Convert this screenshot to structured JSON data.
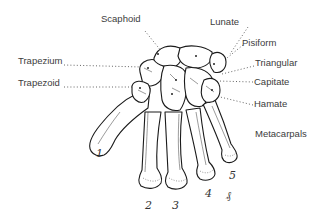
{
  "diagram": {
    "labels": {
      "scaphoid": "Scaphoid",
      "lunate": "Lunate",
      "pisiform": "Pisiform",
      "triangular": "Triangular",
      "trapezium": "Trapezium",
      "trapezoid": "Trapezoid",
      "capitate": "Capitate",
      "hamate": "Hamate",
      "metacarpals": "Metacarpals"
    },
    "metacarpal_numbers": [
      "1",
      "2",
      "3",
      "4",
      "5"
    ],
    "signature": "₰",
    "colors": {
      "background": "#ffffff",
      "ink": "#1a1a1a",
      "label_text": "#3c3c3c",
      "leader_line": "#555555"
    }
  }
}
